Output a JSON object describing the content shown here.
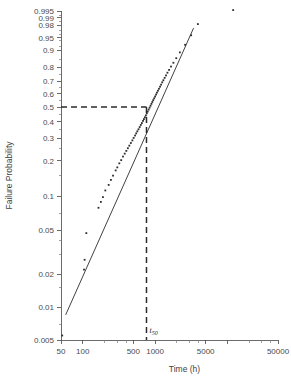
{
  "chart_data": {
    "type": "scatter",
    "title": "",
    "xlabel": "Time (h)",
    "ylabel": "Failure Probability",
    "xscale": "log",
    "yscale": "weibull-probability",
    "xlim": [
      50,
      50000
    ],
    "ylim": [
      0.005,
      0.995
    ],
    "grid": false,
    "legend": null,
    "x_ticks_major": [
      50,
      100,
      500,
      1000,
      5000,
      10000,
      50000
    ],
    "x_tick_labels": [
      "50",
      "100",
      "500",
      "1000",
      "5000",
      "",
      "50000"
    ],
    "x_ticks_minor": [
      200,
      300,
      400,
      2000,
      3000,
      4000,
      20000,
      30000,
      40000
    ],
    "y_ticks_major": [
      0.005,
      0.01,
      0.02,
      0.05,
      0.1,
      0.2,
      0.3,
      0.4,
      0.5,
      0.6,
      0.7,
      0.8,
      0.9,
      0.95,
      0.98,
      0.99,
      0.995
    ],
    "y_tick_labels": [
      "0.005",
      "0.01",
      "0.02",
      "0.05",
      "0.1",
      "0.2",
      "0.3",
      "0.4",
      "0.5",
      "0.6",
      "0.7",
      "0.8",
      "0.9",
      "0.95",
      "0.98",
      "0.99",
      "0.995"
    ],
    "y_ticks_minor": [
      0.007,
      0.015,
      0.03,
      0.04,
      0.07,
      0.15,
      0.25,
      0.35,
      0.45,
      0.55,
      0.65,
      0.75,
      0.85,
      0.92,
      0.94,
      0.96,
      0.97,
      0.985,
      0.992
    ],
    "annotations": [
      {
        "name": "t50-marker",
        "label": "t",
        "sublabel": "50",
        "x_value": 760,
        "y_value": 0.5,
        "guide": "crosshair-dashed",
        "description": "Dashed guide lines marking the median time to failure at 50% failure probability"
      }
    ],
    "fit_line": {
      "name": "weibull-fit-line",
      "x_start": 58,
      "y_start": 0.0085,
      "x_end": 3400,
      "y_end": 0.975
    },
    "points": [
      [
        52,
        0.0055
      ],
      [
        104,
        0.022
      ],
      [
        106,
        0.027
      ],
      [
        112,
        0.047
      ],
      [
        165,
        0.079
      ],
      [
        178,
        0.089
      ],
      [
        190,
        0.098
      ],
      [
        205,
        0.112
      ],
      [
        228,
        0.125
      ],
      [
        245,
        0.138
      ],
      [
        262,
        0.15
      ],
      [
        285,
        0.166
      ],
      [
        300,
        0.176
      ],
      [
        320,
        0.19
      ],
      [
        340,
        0.202
      ],
      [
        360,
        0.216
      ],
      [
        380,
        0.228
      ],
      [
        400,
        0.24
      ],
      [
        420,
        0.252
      ],
      [
        440,
        0.264
      ],
      [
        462,
        0.277
      ],
      [
        485,
        0.29
      ],
      [
        505,
        0.303
      ],
      [
        528,
        0.316
      ],
      [
        548,
        0.328
      ],
      [
        568,
        0.34
      ],
      [
        590,
        0.352
      ],
      [
        612,
        0.365
      ],
      [
        634,
        0.378
      ],
      [
        656,
        0.39
      ],
      [
        680,
        0.404
      ],
      [
        700,
        0.416
      ],
      [
        722,
        0.428
      ],
      [
        745,
        0.441
      ],
      [
        768,
        0.455
      ],
      [
        790,
        0.468
      ],
      [
        815,
        0.482
      ],
      [
        840,
        0.496
      ],
      [
        865,
        0.51
      ],
      [
        890,
        0.524
      ],
      [
        915,
        0.538
      ],
      [
        942,
        0.552
      ],
      [
        970,
        0.566
      ],
      [
        1000,
        0.58
      ],
      [
        1030,
        0.595
      ],
      [
        1060,
        0.61
      ],
      [
        1095,
        0.625
      ],
      [
        1130,
        0.64
      ],
      [
        1170,
        0.656
      ],
      [
        1210,
        0.672
      ],
      [
        1255,
        0.69
      ],
      [
        1300,
        0.706
      ],
      [
        1355,
        0.724
      ],
      [
        1415,
        0.742
      ],
      [
        1480,
        0.762
      ],
      [
        1560,
        0.782
      ],
      [
        1660,
        0.805
      ],
      [
        1790,
        0.83
      ],
      [
        1960,
        0.858
      ],
      [
        2200,
        0.89
      ],
      [
        2600,
        0.925
      ],
      [
        3150,
        0.958
      ],
      [
        3900,
        0.982
      ],
      [
        12000,
        0.9955
      ]
    ]
  },
  "plot_geometry": {
    "left": 61,
    "right": 278,
    "top": 11,
    "bottom": 340
  }
}
